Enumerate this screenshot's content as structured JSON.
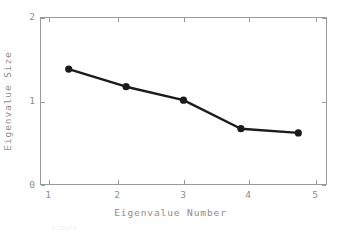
{
  "chart_data": {
    "type": "line",
    "title": "",
    "xlabel": "Eigenvalue Number",
    "ylabel": "Eigenvalue Size",
    "x": [
      1,
      2,
      3,
      4,
      5
    ],
    "values": [
      1.38,
      1.17,
      1.01,
      0.67,
      0.62
    ],
    "series": [
      {
        "name": "Eigenvalue Size",
        "values": [
          1.38,
          1.17,
          1.01,
          0.67,
          0.62
        ]
      }
    ],
    "xlim": [
      0.5,
      5.5
    ],
    "ylim": [
      0,
      2
    ],
    "xticks": [
      "1",
      "2",
      "3",
      "4",
      "5"
    ],
    "yticks": [
      "0",
      "1",
      "2"
    ],
    "ytick_values": [
      0,
      1,
      2
    ],
    "grid": false,
    "legend": "none",
    "marker": "filled-circle",
    "line_color": "#1b1b1b",
    "marker_color": "#1b1b1b",
    "axis_color": "#9a9a9a",
    "text_color": "#8d8d8d",
    "background_color": "#ffffff"
  },
  "axes": {
    "x_title": "Eigenvalue Number",
    "y_title": "Eigenvalue Size",
    "x_tick_labels": [
      "1",
      "2",
      "3",
      "4",
      "5"
    ],
    "y_tick_labels": [
      "2",
      "1",
      "0"
    ]
  },
  "caption": {
    "partial_text": "Figure"
  }
}
